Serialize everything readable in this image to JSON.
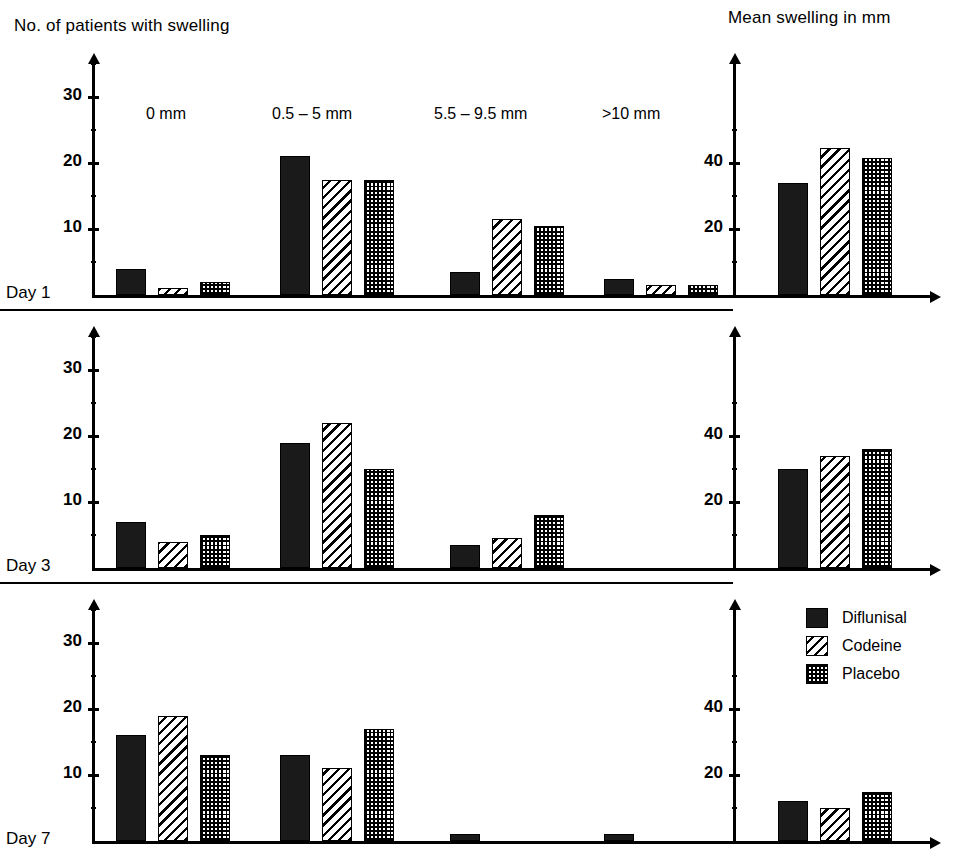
{
  "titles": {
    "left_axis_title": "No. of patients with swelling",
    "right_axis_title": "Mean swelling in mm"
  },
  "groups": [
    {
      "label": "0 mm"
    },
    {
      "label": "0.5 – 5 mm"
    },
    {
      "label": "5.5 – 9.5 mm"
    },
    {
      "label": ">10 mm"
    }
  ],
  "legend": {
    "items": [
      {
        "label": "Diflunisal",
        "pattern": "solid"
      },
      {
        "label": "Codeine",
        "pattern": "hatch"
      },
      {
        "label": "Placebo",
        "pattern": "dots"
      }
    ]
  },
  "left_axis": {
    "ticks": [
      "30",
      "20",
      "10"
    ],
    "tick_values": [
      30,
      20,
      10
    ],
    "max": 35
  },
  "right_axis": {
    "ticks": [
      "40",
      "20"
    ],
    "tick_values": [
      40,
      20
    ],
    "max": 50
  },
  "day_labels": [
    "Day 1",
    "Day 3",
    "Day 7"
  ],
  "chart_data": {
    "type": "bar",
    "subtitle": "Panels stacked by follow-up day; counts at left, mean swelling at right",
    "xlabel": "",
    "ylabel": "No. of patients with swelling",
    "legend_position": "bottom-right",
    "grid": false,
    "series_names": [
      "Diflunisal",
      "Codeine",
      "Placebo"
    ],
    "patterns": [
      "solid",
      "hatch",
      "dots"
    ],
    "panels": [
      {
        "day": "Day 1",
        "counts": {
          "ylabel": "No. of patients with swelling",
          "ylim": [
            0,
            35
          ],
          "yticks": [
            10,
            20,
            30
          ],
          "categories": [
            "0 mm",
            "0.5 – 5 mm",
            "5.5 – 9.5 mm",
            ">10 mm"
          ],
          "series": [
            {
              "name": "Diflunisal",
              "values": [
                4,
                21,
                3.5,
                2.5
              ]
            },
            {
              "name": "Codeine",
              "values": [
                1,
                17.5,
                11.5,
                1.5
              ]
            },
            {
              "name": "Placebo",
              "values": [
                2,
                17.5,
                10.5,
                1.5
              ]
            }
          ]
        },
        "mean_swelling": {
          "ylabel": "Mean swelling in mm",
          "ylim": [
            0,
            50
          ],
          "yticks": [
            20,
            40
          ],
          "series": [
            {
              "name": "Diflunisal",
              "value": 34
            },
            {
              "name": "Codeine",
              "value": 44.5
            },
            {
              "name": "Placebo",
              "value": 41.5
            }
          ]
        }
      },
      {
        "day": "Day 3",
        "counts": {
          "ylabel": "No. of patients with swelling",
          "ylim": [
            0,
            35
          ],
          "yticks": [
            10,
            20,
            30
          ],
          "categories": [
            "0 mm",
            "0.5 – 5 mm",
            "5.5 – 9.5 mm",
            ">10 mm"
          ],
          "series": [
            {
              "name": "Diflunisal",
              "values": [
                7,
                19,
                3.5,
                0
              ]
            },
            {
              "name": "Codeine",
              "values": [
                4,
                22,
                4.5,
                0
              ]
            },
            {
              "name": "Placebo",
              "values": [
                5,
                15,
                8,
                0
              ]
            }
          ]
        },
        "mean_swelling": {
          "ylabel": "Mean swelling in mm",
          "ylim": [
            0,
            50
          ],
          "yticks": [
            20,
            40
          ],
          "series": [
            {
              "name": "Diflunisal",
              "value": 30
            },
            {
              "name": "Codeine",
              "value": 34
            },
            {
              "name": "Placebo",
              "value": 36
            }
          ]
        }
      },
      {
        "day": "Day 7",
        "counts": {
          "ylabel": "No. of patients with swelling",
          "ylim": [
            0,
            35
          ],
          "yticks": [
            10,
            20,
            30
          ],
          "categories": [
            "0 mm",
            "0.5 – 5 mm",
            "5.5 – 9.5 mm",
            ">10 mm"
          ],
          "series": [
            {
              "name": "Diflunisal",
              "values": [
                16,
                13,
                1,
                1
              ]
            },
            {
              "name": "Codeine",
              "values": [
                19,
                11,
                0,
                0
              ]
            },
            {
              "name": "Placebo",
              "values": [
                13,
                17,
                0,
                0
              ]
            }
          ]
        },
        "mean_swelling": {
          "ylabel": "Mean swelling in mm",
          "ylim": [
            0,
            50
          ],
          "yticks": [
            20,
            40
          ],
          "series": [
            {
              "name": "Diflunisal",
              "value": 12
            },
            {
              "name": "Codeine",
              "value": 10
            },
            {
              "name": "Placebo",
              "value": 15
            }
          ]
        }
      }
    ]
  }
}
